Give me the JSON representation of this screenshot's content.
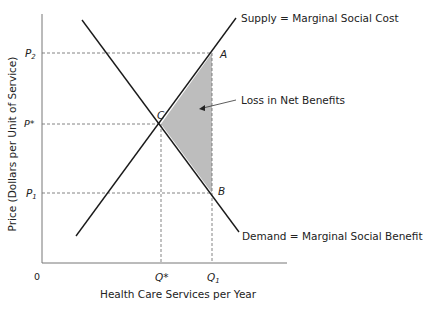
{
  "diagram": {
    "type": "supply-demand deadweight loss",
    "y_axis_label": "Price (Dollars per Unit of Service)",
    "x_axis_label": "Health Care Services per Year",
    "origin_label": "0",
    "price_labels": {
      "p2": {
        "main": "P",
        "sub": "2"
      },
      "pstar": {
        "main": "P*"
      },
      "p1": {
        "main": "P",
        "sub": "1"
      }
    },
    "quantity_labels": {
      "qstar": {
        "main": "Q*"
      },
      "q1": {
        "main": "Q",
        "sub": "1"
      }
    },
    "point_labels": {
      "a": "A",
      "b": "B",
      "c": "C"
    },
    "curves": {
      "supply": "Supply = Marginal Social Cost",
      "demand": "Demand = Marginal Social Benefit"
    },
    "annotation": "Loss in Net Benefits",
    "colors": {
      "shade": "#bdbdbd",
      "line": "#1a1a1a",
      "axis": "#777777",
      "dash": "#666666"
    }
  }
}
